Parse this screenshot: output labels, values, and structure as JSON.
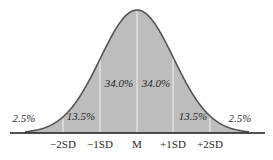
{
  "chart_data": {
    "type": "area",
    "title": "",
    "xlabel": "",
    "ylabel": "",
    "tick_labels": [
      "−2SD",
      "−1SD",
      "M",
      "+1SD",
      "+2SD"
    ],
    "regions": [
      {
        "range": "below -2SD",
        "percent": "2.5%"
      },
      {
        "range": "-2SD to -1SD",
        "percent": "13.5%"
      },
      {
        "range": "-1SD to M",
        "percent": "34.0%"
      },
      {
        "range": "M to +1SD",
        "percent": "34.0%"
      },
      {
        "range": "+1SD to +2SD",
        "percent": "13.5%"
      },
      {
        "range": "above +2SD",
        "percent": "2.5%"
      }
    ],
    "grid": false,
    "legend": "none",
    "colors": {
      "fill": "#bdbdbd",
      "stroke": "#555555",
      "divider": "#f2f2f2",
      "axis": "#1a1a1a"
    }
  },
  "labels": {
    "ticks": [
      "−2SD",
      "−1SD",
      "M",
      "+1SD",
      "+2SD"
    ],
    "percents": [
      "2.5%",
      "13.5%",
      "34.0%",
      "34.0%",
      "13.5%",
      "2.5%"
    ]
  }
}
